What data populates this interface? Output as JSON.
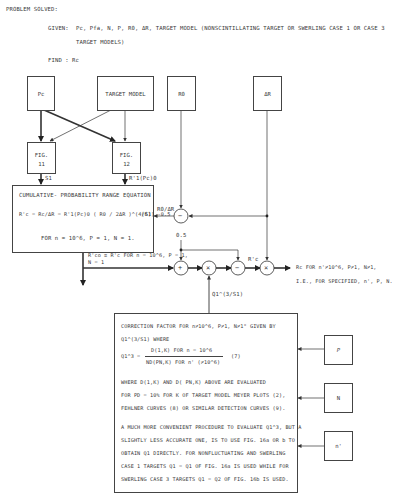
{
  "header": {
    "title": "PROBLEM SOLVED:",
    "given_label": "GIVEN:",
    "given_text": "Pc, Pfa, N, P, R0, ΔR, TARGET MODEL (NONSCINTILLATING TARGET OR SWERLING CASE 1 OR CASE 3",
    "given_text_cont": "TARGET MODELS)",
    "find_label": "FIND :",
    "find_text": "Rc"
  },
  "inputs": {
    "pc": "Pc",
    "target_model": "TARGET MODEL",
    "r0": "R0",
    "delta_r": "ΔR"
  },
  "figures": {
    "fig11_line1": "FIG.",
    "fig11_line2": "11",
    "fig12_line1": "FIG.",
    "fig12_line2": "12",
    "fig11_output": "S1",
    "fig12_output": "R'1(Pc)0"
  },
  "equation_box": {
    "title": "CUMULATIVE- PROBABILITY RANGE EQUATION",
    "equation": "R'c = Rc/ΔR = R'1(Pc)0 ( R0 / 2ΔR )^(4/S1) -0.5",
    "equation_number": "(6)",
    "condition": "FOR n = 10^6,  P = 1,  N = 1."
  },
  "flow": {
    "r0_over_dr_label": "R0/ΔR",
    "half_label": "0.5",
    "rco_label": "R'co ≡ R'c FOR n = 10^6,  P = 1,",
    "rco_label_cont": "N = 1",
    "rc_prime_label": "R'c",
    "q_label": "Q1^(3/S1)",
    "operators": [
      "−",
      "+",
      "×",
      "−",
      "×"
    ],
    "output_line1": "Rc FOR n'≠10^6, P≠1, N≠1,",
    "output_line2": "I.E., FOR SPECIFIED, n', P, N."
  },
  "correction_box": {
    "line1": "CORRECTION FACTOR FOR n≠10^6, P≠1, N≠1\" GIVEN BY",
    "line2": "Q1^(3/S1)  WHERE",
    "eq_lhs": "Q1^3 =",
    "eq_num": "D(1,K) FOR n = 10^6",
    "eq_den": "ND(PN,K) FOR n' (≠10^6)",
    "eq_number": "(7)",
    "para1_l1": "WHERE D(1,K) AND D( PN,K) ABOVE ARE EVALUATED",
    "para1_l2": "FOR PD = 10% FOR K OF TARGET MODEL MEYER PLOTS (2),",
    "para1_l3": "FEHLNER CURVES (8) OR SIMILAR DETECTION CURVES (9).",
    "para2_l1": "A MUCH MORE CONVENIENT PROCEDURE TO EVALUATE Q1^3, BUT A",
    "para2_l2": "SLIGHTLY LESS ACCURATE ONE, IS TO USE FIG. 16a OR b TO",
    "para2_l3": "OBTAIN Q1 DIRECTLY.  FOR NONFLUCTUATING AND SWERLING",
    "para2_l4": "CASE 1 TARGETS Q1 = Q1 OF FIG. 16a IS USED WHILE FOR",
    "para2_l5": "SWERLING CASE 3 TARGETS Q1 = Q2 OF FIG. 16b IS USED."
  },
  "side_inputs": {
    "p": "P",
    "n": "N",
    "n_prime": "n'"
  }
}
